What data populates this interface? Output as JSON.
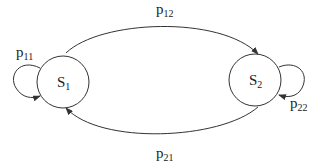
{
  "diagram": {
    "type": "markov-chain",
    "states": [
      {
        "id": "s1",
        "label": "S",
        "subscript": "1"
      },
      {
        "id": "s2",
        "label": "S",
        "subscript": "2"
      }
    ],
    "transitions": [
      {
        "id": "p11",
        "from": "s1",
        "to": "s1",
        "label": "p",
        "subscript": "11"
      },
      {
        "id": "p12",
        "from": "s1",
        "to": "s2",
        "label": "p",
        "subscript": "12"
      },
      {
        "id": "p21",
        "from": "s2",
        "to": "s1",
        "label": "p",
        "subscript": "21"
      },
      {
        "id": "p22",
        "from": "s2",
        "to": "s2",
        "label": "p",
        "subscript": "22"
      }
    ]
  }
}
